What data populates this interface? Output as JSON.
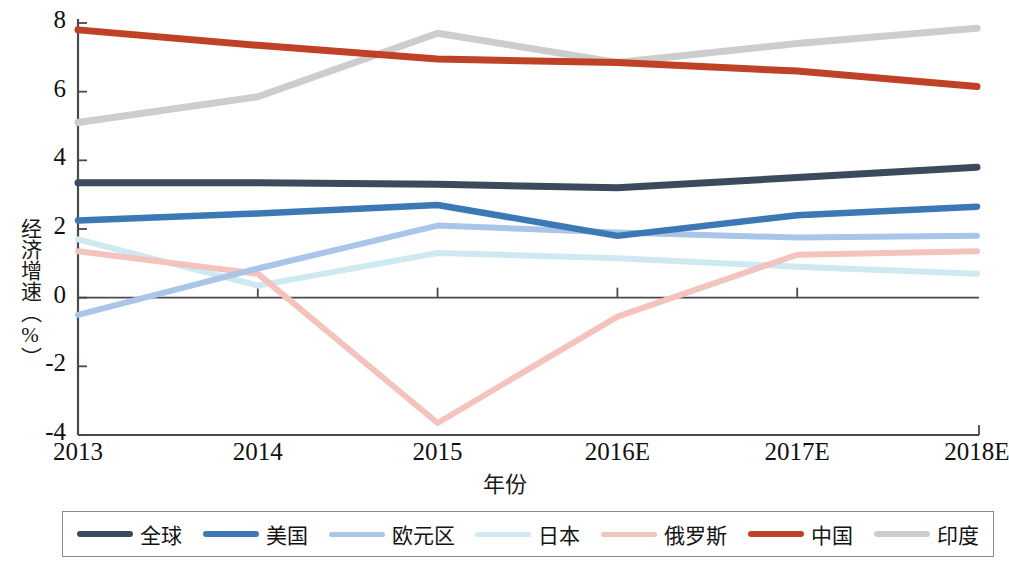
{
  "chart_data": {
    "type": "line",
    "title": "",
    "xlabel": "年份",
    "ylabel": "经济增速（%）",
    "categories": [
      "2013",
      "2014",
      "2015",
      "2016E",
      "2017E",
      "2018E"
    ],
    "ylim": [
      -4,
      8
    ],
    "yticks": [
      "8",
      "6",
      "4",
      "2",
      "0",
      "-2",
      "-4"
    ],
    "ytick_values": [
      8,
      6,
      4,
      2,
      0,
      -2,
      -4
    ],
    "grid": false,
    "legend_position": "bottom",
    "series": [
      {
        "name": "全球",
        "color": "#3b4a5c",
        "width": 7.0,
        "values": [
          3.35,
          3.35,
          3.3,
          3.2,
          3.5,
          3.8
        ]
      },
      {
        "name": "美国",
        "color": "#3b78b4",
        "width": 6.5,
        "values": [
          2.25,
          2.45,
          2.7,
          1.8,
          2.4,
          2.65
        ]
      },
      {
        "name": "欧元区",
        "color": "#a9c6e8",
        "width": 6.0,
        "values": [
          -0.5,
          0.85,
          2.1,
          1.9,
          1.75,
          1.8
        ]
      },
      {
        "name": "日本",
        "color": "#cfe9f2",
        "width": 6.0,
        "values": [
          1.7,
          0.35,
          1.3,
          1.15,
          0.9,
          0.7
        ]
      },
      {
        "name": "俄罗斯",
        "color": "#f4c3bd",
        "width": 6.0,
        "values": [
          1.35,
          0.7,
          -3.65,
          -0.55,
          1.25,
          1.35
        ]
      },
      {
        "name": "中国",
        "color": "#bf4126",
        "width": 7.0,
        "values": [
          7.8,
          7.35,
          6.95,
          6.85,
          6.6,
          6.15
        ]
      },
      {
        "name": "印度",
        "color": "#cdcdcd",
        "width": 7.0,
        "values": [
          5.1,
          5.85,
          7.7,
          6.85,
          7.4,
          7.85
        ]
      }
    ]
  },
  "legend": {
    "items": [
      {
        "label": "全球"
      },
      {
        "label": "美国"
      },
      {
        "label": "欧元区"
      },
      {
        "label": "日本"
      },
      {
        "label": "俄罗斯"
      },
      {
        "label": "中国"
      },
      {
        "label": "印度"
      }
    ]
  }
}
